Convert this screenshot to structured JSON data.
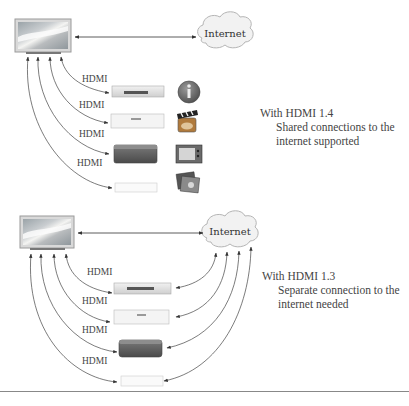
{
  "panels": [
    {
      "id": "hdmi-1-4",
      "cloud_label": "Internet",
      "connection_labels": [
        "HDMI",
        "HDMI",
        "HDMI",
        "HDMI"
      ],
      "devices": [
        "dvd-player",
        "set-top-box",
        "media-box",
        "game-console"
      ],
      "icons": [
        "info-icon",
        "clapperboard-icon",
        "tv-icon",
        "photos-icon"
      ],
      "caption_title": "With HDMI 1.4",
      "caption_lines": [
        "Shared connections to the",
        "internet supported"
      ]
    },
    {
      "id": "hdmi-1-3",
      "cloud_label": "Internet",
      "connection_labels": [
        "HDMI",
        "HDMI",
        "HDMI",
        "HDMI"
      ],
      "devices": [
        "dvd-player",
        "set-top-box",
        "media-box",
        "game-console"
      ],
      "caption_title": "With HDMI 1.3",
      "caption_lines": [
        "Separate connection to the",
        "internet needed"
      ]
    }
  ],
  "colors": {
    "line": "#333333",
    "cloud_fill": "#f2f2f2",
    "cloud_stroke": "#b5b5b5",
    "rule": "#888888"
  }
}
